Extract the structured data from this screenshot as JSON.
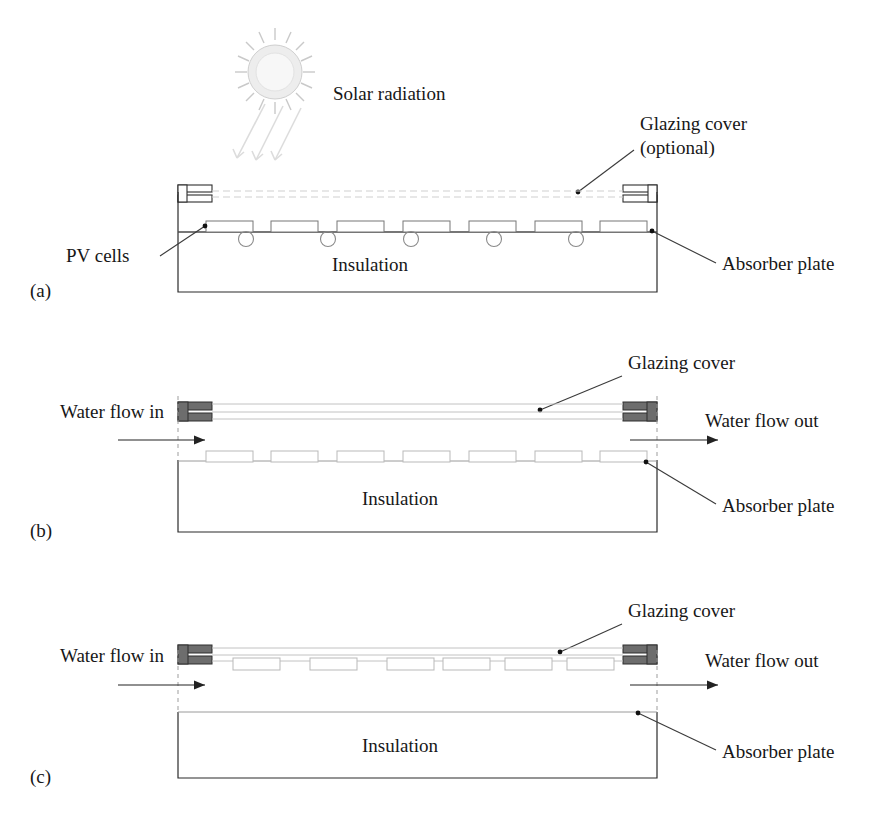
{
  "figure": {
    "background": "#ffffff",
    "ink": "#1a1a1a"
  },
  "solar": {
    "label": "Solar radiation",
    "icon": "sun-icon",
    "beam_count": 3
  },
  "panels": [
    {
      "id": "a",
      "caption": "(a)",
      "type": "pv-thermal-hybrid-collector",
      "labels": {
        "glazing": "Glazing cover",
        "glazing_note": "(optional)",
        "pv_cells": "PV cells",
        "insulation": "Insulation",
        "absorber": "Absorber plate"
      },
      "counts": {
        "cells": 7,
        "tubes": 5
      },
      "glazing_style": "dashed-optional",
      "has_flow_arrows": false
    },
    {
      "id": "b",
      "caption": "(b)",
      "type": "glazed-water-collector",
      "labels": {
        "glazing": "Glazing cover",
        "water_in": "Water flow in",
        "water_out": "Water flow out",
        "insulation": "Insulation",
        "absorber": "Absorber plate"
      },
      "counts": {
        "cells": 7,
        "tubes": 0
      },
      "glazing_style": "solid-channel",
      "has_flow_arrows": true
    },
    {
      "id": "c",
      "caption": "(c)",
      "type": "direct-flow-collector",
      "labels": {
        "glazing": "Glazing cover",
        "water_in": "Water flow in",
        "water_out": "Water flow out",
        "insulation": "Insulation",
        "absorber": "Absorber plate"
      },
      "counts": {
        "cells": 6,
        "tubes": 0
      },
      "glazing_style": "solid-channel",
      "has_flow_arrows": true
    }
  ],
  "colors": {
    "outline": "#2b2b2b",
    "plate": "#4a4a4a",
    "glazing": "#c2c2c2",
    "header_fill": "#6d6d6d",
    "leader": "#3a3a3a"
  }
}
